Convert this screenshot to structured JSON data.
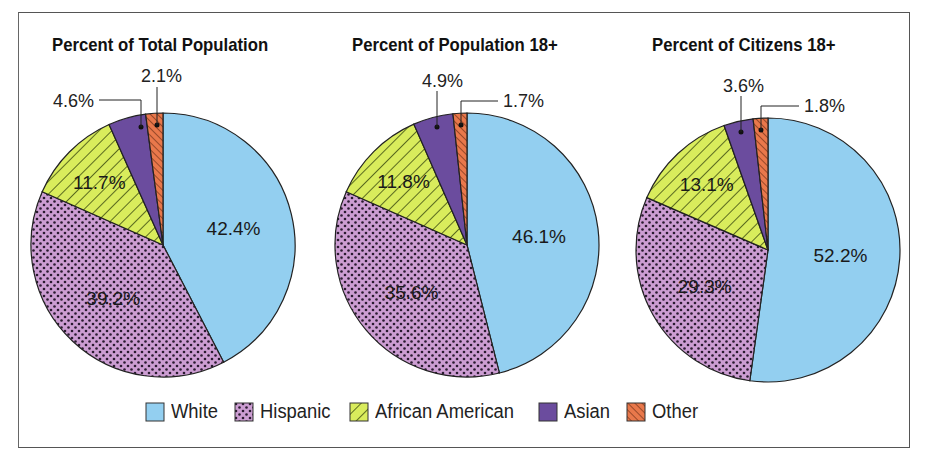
{
  "colors": {
    "white": "#93cff0",
    "hispanic": "#cc9dd2",
    "african_american": "#d9ec5c",
    "asian": "#6b4c9e",
    "other": "#e9784b"
  },
  "panels": [
    {
      "title": "Percent of Total Population"
    },
    {
      "title": "Percent of Population 18+"
    },
    {
      "title": "Percent of Citizens 18+"
    }
  ],
  "legend": [
    {
      "label": "White",
      "key": "white"
    },
    {
      "label": "Hispanic",
      "key": "hispanic"
    },
    {
      "label": "African American",
      "key": "african_american"
    },
    {
      "label": "Asian",
      "key": "asian"
    },
    {
      "label": "Other",
      "key": "other"
    }
  ],
  "chart_data": [
    {
      "type": "pie",
      "title": "Percent of Total Population",
      "categories": [
        "White",
        "Hispanic",
        "African American",
        "Asian",
        "Other"
      ],
      "values": [
        42.4,
        39.2,
        11.7,
        4.6,
        2.1
      ],
      "labels": [
        "42.4%",
        "39.2%",
        "11.7%",
        "4.6%",
        "2.1%"
      ]
    },
    {
      "type": "pie",
      "title": "Percent of Population 18+",
      "categories": [
        "White",
        "Hispanic",
        "African American",
        "Asian",
        "Other"
      ],
      "values": [
        46.1,
        35.6,
        11.8,
        4.9,
        1.7
      ],
      "labels": [
        "46.1%",
        "35.6%",
        "11.8%",
        "4.9%",
        "1.7%"
      ]
    },
    {
      "type": "pie",
      "title": "Percent of Citizens 18+",
      "categories": [
        "White",
        "Hispanic",
        "African American",
        "Asian",
        "Other"
      ],
      "values": [
        52.2,
        29.3,
        13.1,
        3.6,
        1.8
      ],
      "labels": [
        "52.2%",
        "29.3%",
        "13.1%",
        "3.6%",
        "1.8%"
      ]
    }
  ]
}
